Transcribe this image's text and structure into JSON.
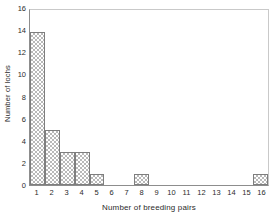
{
  "chart_data": {
    "type": "bar",
    "title": "",
    "subtitle": "",
    "xlabel": "Number of breeding pairs",
    "ylabel": "Number of lochs",
    "categories": [
      1,
      2,
      3,
      4,
      5,
      6,
      7,
      8,
      9,
      10,
      11,
      12,
      13,
      14,
      15,
      16
    ],
    "values": [
      14,
      5,
      3,
      3,
      1,
      0,
      0,
      1,
      0,
      0,
      0,
      0,
      0,
      0,
      0,
      1
    ],
    "xtick_labels": [
      "1",
      "2",
      "3",
      "4",
      "5",
      "6",
      "7",
      "8",
      "9",
      "10",
      "11",
      "12",
      "13",
      "14",
      "15",
      "16"
    ],
    "ytick_labels": [
      "0",
      "2",
      "4",
      "6",
      "8",
      "10",
      "12",
      "14",
      "16"
    ],
    "ytick_values": [
      0,
      2,
      4,
      6,
      8,
      10,
      12,
      14,
      16
    ],
    "ylim": [
      0,
      16
    ],
    "xlim": [
      0.5,
      16.5
    ],
    "grid": false,
    "legend": null,
    "annotations": [],
    "bar_style": {
      "fill": "checkerboard-hatch",
      "fill_color": "#b9b9b9",
      "edge_color": "#7e7e7e",
      "background": "#ffffff",
      "contiguous": true
    },
    "frame_color": "#8d8d8d",
    "background_color": "#ffffff"
  }
}
